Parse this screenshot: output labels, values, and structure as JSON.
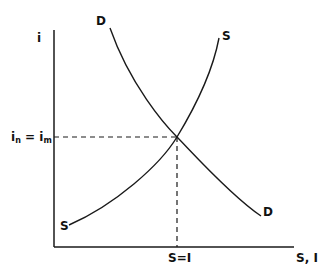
{
  "diagram": {
    "type": "supply-demand",
    "colors": {
      "line": "#1a1a1a",
      "text": "#111111",
      "background": "#ffffff"
    },
    "axes": {
      "y_label": "i",
      "x_label": "S, I"
    },
    "curves": {
      "demand": {
        "label_top": "D",
        "label_bottom": "D"
      },
      "supply": {
        "label_top": "S",
        "label_bottom": "S"
      }
    },
    "equilibrium": {
      "y_label_base": "i",
      "y_label_sub1": "n",
      "y_label_eq": " = ",
      "y_label_base2": "i",
      "y_label_sub2": "m",
      "x_label": "S=I"
    }
  }
}
